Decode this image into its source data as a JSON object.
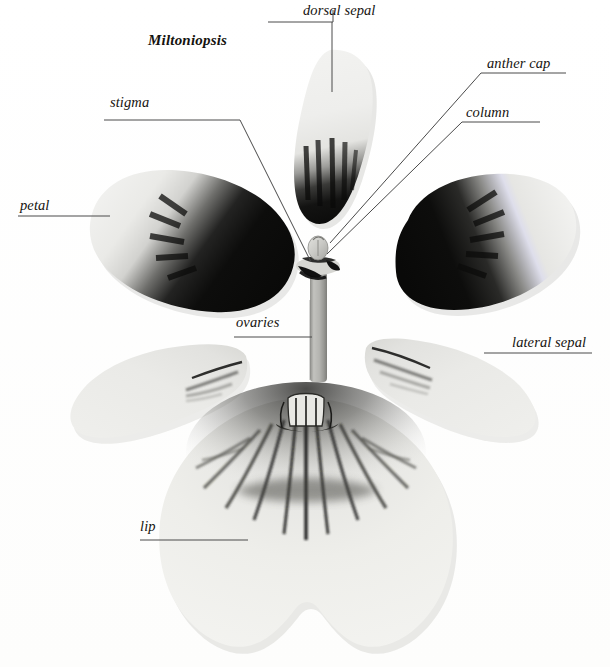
{
  "plate": {
    "title": "Miltoniopsis",
    "background_color": "#ffffff",
    "ink_color": "#15130f",
    "leader_color": "#4a4a4a",
    "description": "Dissected orchid flower parts arranged radially: dorsal sepal, two petals, two lateral sepals, lip, and central column"
  },
  "labels": {
    "genus": "Miltoniopsis",
    "dorsal_sepal": "dorsal sepal",
    "anther_cap": "anther cap",
    "column": "column",
    "stigma": "stigma",
    "petal": "petal",
    "ovaries": "ovaries",
    "lateral_sepal": "lateral sepal",
    "lip": "lip"
  },
  "parts": [
    {
      "name": "dorsal-sepal",
      "label": "dorsal sepal",
      "position": "top-center",
      "pigment": "pale cream upper half, dense black streaked base"
    },
    {
      "name": "petal-left",
      "label": "petal",
      "position": "mid-left",
      "pigment": "pale outer margin grading to solid black inner blotch"
    },
    {
      "name": "petal-right",
      "label": "petal",
      "position": "mid-right",
      "pigment": "solid black inner blotch grading to pale outer margin"
    },
    {
      "name": "lateral-sepal-left",
      "label": "lateral sepal",
      "position": "lower-left",
      "pigment": "pale with dark streak near inner tip"
    },
    {
      "name": "lateral-sepal-right",
      "label": "lateral sepal",
      "position": "lower-right",
      "pigment": "pale with dark streak near inner tip"
    },
    {
      "name": "lip",
      "label": "lip",
      "position": "bottom-center",
      "pigment": "broad bilobed blade, dark radiating mask streaks from central callus"
    },
    {
      "name": "column",
      "label": "column",
      "position": "center",
      "pigment": "grey stalk with anther cap above and dark stigma band"
    }
  ],
  "leaders": [
    {
      "name": "leader-dorsal-sepal",
      "from": "dorsal sepal label",
      "to": "dorsal sepal blade"
    },
    {
      "name": "leader-anther-cap",
      "from": "anther cap label",
      "to": "anther cap apex"
    },
    {
      "name": "leader-column",
      "from": "column label",
      "to": "column body"
    },
    {
      "name": "leader-stigma",
      "from": "stigma label",
      "to": "stigma band"
    },
    {
      "name": "leader-petal",
      "from": "petal label",
      "to": "left petal margin"
    },
    {
      "name": "leader-ovaries",
      "from": "ovaries label",
      "to": "ovary stalk"
    },
    {
      "name": "leader-lateral-sepal",
      "from": "lateral sepal label",
      "to": "right lateral sepal"
    },
    {
      "name": "leader-lip",
      "from": "lip label",
      "to": "lip blade"
    }
  ]
}
